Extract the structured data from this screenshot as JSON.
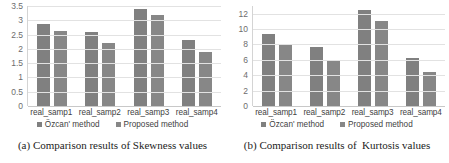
{
  "figure": {
    "panels": [
      {
        "id": "panel-a",
        "caption": "(a) Comparison results of Skewness values",
        "legend": [
          {
            "label": "Özcan' method",
            "color": "#808080"
          },
          {
            "label": "Proposed method",
            "color": "#878787"
          }
        ],
        "chart_data": {
          "type": "bar",
          "title": "",
          "xlabel": "",
          "ylabel": "",
          "categories": [
            "real_samp1",
            "real_samp2",
            "real_samp3",
            "real_samp4"
          ],
          "series": [
            {
              "name": "Özcan' method",
              "values": [
                2.88,
                2.58,
                3.4,
                2.3
              ]
            },
            {
              "name": "Proposed method",
              "values": [
                2.62,
                2.2,
                3.18,
                1.9
              ]
            }
          ],
          "ylim": [
            0,
            3.5
          ],
          "yticks": [
            0,
            0.5,
            1,
            1.5,
            2,
            2.5,
            3,
            3.5
          ],
          "ytick_labels": [
            "0",
            "0.5",
            "1",
            "1.5",
            "2",
            "2.5",
            "3",
            "3.5"
          ],
          "grid": true,
          "legend_position": "bottom"
        }
      },
      {
        "id": "panel-b",
        "caption": "(b) Comparison results of  Kurtosis values",
        "legend": [
          {
            "label": "Özcan' method",
            "color": "#808080"
          },
          {
            "label": "Proposed method",
            "color": "#878787"
          }
        ],
        "chart_data": {
          "type": "bar",
          "title": "",
          "xlabel": "",
          "ylabel": "",
          "categories": [
            "real_samp1",
            "real_samp2",
            "real_samp3",
            "real_samp4"
          ],
          "series": [
            {
              "name": "Özcan' method",
              "values": [
                9.4,
                7.65,
                12.5,
                6.25
              ]
            },
            {
              "name": "Proposed method",
              "values": [
                7.9,
                5.8,
                11.1,
                4.45
              ]
            }
          ],
          "ylim": [
            0,
            13
          ],
          "yticks": [
            0,
            2,
            4,
            6,
            8,
            10,
            12
          ],
          "ytick_labels": [
            "0",
            "2",
            "4",
            "6",
            "8",
            "10",
            "12"
          ],
          "grid": true,
          "legend_position": "bottom"
        }
      }
    ]
  }
}
